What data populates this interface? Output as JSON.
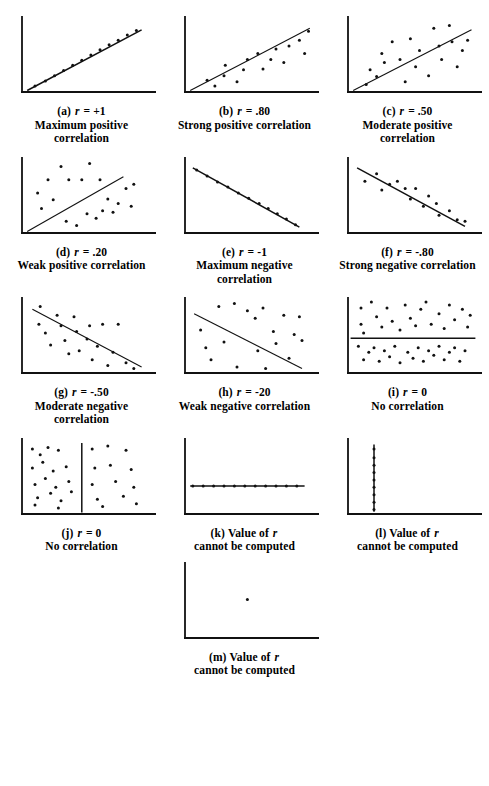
{
  "figure": {
    "ink_color": "#111111",
    "background": "#ffffff",
    "panel_count": 13
  },
  "chart_data": {
    "type": "scatter",
    "xlabel": "",
    "ylabel": "",
    "xlim": [
      0,
      100
    ],
    "ylim": [
      0,
      100
    ],
    "grid": false,
    "legend": "none",
    "panels": [
      {
        "id": "a",
        "label": "(a)",
        "r_text": "r = +1",
        "r_value": 1.0,
        "caption_line1": "Maximum positive",
        "caption_line2": "correlation",
        "has_line": true,
        "line": {
          "x1": 4,
          "y1": 2,
          "x2": 92,
          "y2": 84
        },
        "points": [
          [
            10,
            8
          ],
          [
            18,
            15
          ],
          [
            25,
            22
          ],
          [
            32,
            29
          ],
          [
            39,
            36
          ],
          [
            46,
            43
          ],
          [
            53,
            50
          ],
          [
            60,
            57
          ],
          [
            67,
            64
          ],
          [
            74,
            70
          ],
          [
            81,
            77
          ],
          [
            88,
            83
          ]
        ]
      },
      {
        "id": "b",
        "label": "(b)",
        "r_text": "r = .80",
        "r_value": 0.8,
        "caption_line1": "Strong positive correlation",
        "caption_line2": "",
        "has_line": true,
        "line": {
          "x1": 4,
          "y1": 2,
          "x2": 96,
          "y2": 86
        },
        "points": [
          [
            17,
            16
          ],
          [
            23,
            8
          ],
          [
            30,
            22
          ],
          [
            31,
            36
          ],
          [
            40,
            14
          ],
          [
            45,
            30
          ],
          [
            48,
            44
          ],
          [
            56,
            52
          ],
          [
            60,
            31
          ],
          [
            66,
            44
          ],
          [
            70,
            58
          ],
          [
            76,
            40
          ],
          [
            80,
            62
          ],
          [
            88,
            70
          ],
          [
            92,
            52
          ],
          [
            95,
            82
          ]
        ]
      },
      {
        "id": "c",
        "label": "(c)",
        "r_text": "r = .50",
        "r_value": 0.5,
        "caption_line1": "Moderate positive",
        "caption_line2": "correlation",
        "has_line": true,
        "line": {
          "x1": 4,
          "y1": 2,
          "x2": 95,
          "y2": 84
        },
        "points": [
          [
            14,
            10
          ],
          [
            17,
            30
          ],
          [
            22,
            21
          ],
          [
            26,
            52
          ],
          [
            28,
            40
          ],
          [
            34,
            68
          ],
          [
            40,
            44
          ],
          [
            44,
            14
          ],
          [
            48,
            72
          ],
          [
            52,
            34
          ],
          [
            55,
            56
          ],
          [
            62,
            22
          ],
          [
            66,
            86
          ],
          [
            70,
            62
          ],
          [
            72,
            44
          ],
          [
            78,
            90
          ],
          [
            80,
            68
          ],
          [
            84,
            34
          ],
          [
            88,
            56
          ],
          [
            92,
            70
          ]
        ]
      },
      {
        "id": "d",
        "label": "(d)",
        "r_text": "r = .20",
        "r_value": 0.2,
        "caption_line1": "Weak positive correlation",
        "caption_line2": "",
        "has_line": true,
        "line": {
          "x1": 4,
          "y1": 2,
          "x2": 78,
          "y2": 76
        },
        "points": [
          [
            12,
            54
          ],
          [
            15,
            33
          ],
          [
            20,
            72
          ],
          [
            24,
            45
          ],
          [
            30,
            90
          ],
          [
            34,
            16
          ],
          [
            36,
            72
          ],
          [
            42,
            10
          ],
          [
            46,
            72
          ],
          [
            50,
            26
          ],
          [
            52,
            94
          ],
          [
            57,
            20
          ],
          [
            60,
            72
          ],
          [
            62,
            30
          ],
          [
            66,
            46
          ],
          [
            70,
            28
          ],
          [
            74,
            40
          ],
          [
            80,
            60
          ],
          [
            84,
            36
          ],
          [
            86,
            66
          ]
        ]
      },
      {
        "id": "e",
        "label": "(e)",
        "r_text": "r = -1",
        "r_value": -1.0,
        "caption_line1": "Maximum negative",
        "caption_line2": "correlation",
        "has_line": true,
        "line": {
          "x1": 6,
          "y1": 88,
          "x2": 88,
          "y2": 8
        },
        "points": [
          [
            9,
            85
          ],
          [
            17,
            77
          ],
          [
            25,
            69
          ],
          [
            33,
            62
          ],
          [
            41,
            54
          ],
          [
            49,
            47
          ],
          [
            57,
            40
          ],
          [
            64,
            33
          ],
          [
            71,
            26
          ],
          [
            78,
            19
          ],
          [
            85,
            11
          ]
        ]
      },
      {
        "id": "f",
        "label": "(f)",
        "r_text": "r = -.80",
        "r_value": -0.8,
        "caption_line1": "Strong negative correlation",
        "caption_line2": "",
        "has_line": true,
        "line": {
          "x1": 7,
          "y1": 88,
          "x2": 90,
          "y2": 9
        },
        "points": [
          [
            13,
            70
          ],
          [
            22,
            80
          ],
          [
            26,
            58
          ],
          [
            32,
            66
          ],
          [
            38,
            70
          ],
          [
            44,
            60
          ],
          [
            48,
            46
          ],
          [
            52,
            60
          ],
          [
            58,
            36
          ],
          [
            62,
            50
          ],
          [
            68,
            40
          ],
          [
            70,
            24
          ],
          [
            78,
            30
          ],
          [
            84,
            18
          ],
          [
            90,
            16
          ]
        ]
      },
      {
        "id": "g",
        "label": "(g)",
        "r_text": "r = -.50",
        "r_value": -0.5,
        "caption_line1": "Moderate negative",
        "caption_line2": "correlation",
        "has_line": true,
        "line": {
          "x1": 8,
          "y1": 86,
          "x2": 92,
          "y2": 8
        },
        "points": [
          [
            14,
            90
          ],
          [
            13,
            66
          ],
          [
            18,
            54
          ],
          [
            22,
            38
          ],
          [
            27,
            78
          ],
          [
            30,
            64
          ],
          [
            33,
            44
          ],
          [
            36,
            26
          ],
          [
            40,
            76
          ],
          [
            42,
            56
          ],
          [
            44,
            30
          ],
          [
            50,
            46
          ],
          [
            52,
            64
          ],
          [
            54,
            18
          ],
          [
            58,
            36
          ],
          [
            62,
            66
          ],
          [
            66,
            10
          ],
          [
            70,
            28
          ],
          [
            74,
            66
          ],
          [
            80,
            14
          ],
          [
            86,
            6
          ]
        ]
      },
      {
        "id": "h",
        "label": "(h)",
        "r_text": "r = -20",
        "r_value": -0.2,
        "caption_line1": "Weak negative correlation",
        "caption_line2": "",
        "has_line": true,
        "line": {
          "x1": 7,
          "y1": 80,
          "x2": 90,
          "y2": 6
        },
        "points": [
          [
            12,
            58
          ],
          [
            16,
            34
          ],
          [
            20,
            18
          ],
          [
            26,
            90
          ],
          [
            30,
            42
          ],
          [
            38,
            94
          ],
          [
            40,
            8
          ],
          [
            48,
            84
          ],
          [
            54,
            74
          ],
          [
            56,
            30
          ],
          [
            60,
            88
          ],
          [
            62,
            6
          ],
          [
            68,
            56
          ],
          [
            70,
            40
          ],
          [
            76,
            78
          ],
          [
            80,
            20
          ],
          [
            84,
            52
          ],
          [
            88,
            76
          ],
          [
            90,
            44
          ]
        ]
      },
      {
        "id": "i",
        "label": "(i)",
        "r_text": "r = 0",
        "r_value": 0.0,
        "caption_line1": "No correlation",
        "caption_line2": "",
        "has_line": true,
        "line": {
          "x1": 2,
          "y1": 47,
          "x2": 98,
          "y2": 47
        },
        "line_style": "horizontal",
        "points": [
          [
            10,
            88
          ],
          [
            10,
            66
          ],
          [
            12,
            54
          ],
          [
            18,
            96
          ],
          [
            22,
            76
          ],
          [
            26,
            62
          ],
          [
            30,
            88
          ],
          [
            34,
            70
          ],
          [
            40,
            58
          ],
          [
            44,
            92
          ],
          [
            48,
            74
          ],
          [
            52,
            64
          ],
          [
            56,
            86
          ],
          [
            60,
            96
          ],
          [
            64,
            66
          ],
          [
            70,
            80
          ],
          [
            74,
            60
          ],
          [
            78,
            92
          ],
          [
            82,
            72
          ],
          [
            88,
            86
          ],
          [
            92,
            62
          ],
          [
            94,
            78
          ],
          [
            8,
            36
          ],
          [
            12,
            18
          ],
          [
            16,
            28
          ],
          [
            20,
            34
          ],
          [
            24,
            16
          ],
          [
            28,
            30
          ],
          [
            32,
            22
          ],
          [
            36,
            36
          ],
          [
            40,
            14
          ],
          [
            46,
            28
          ],
          [
            50,
            20
          ],
          [
            54,
            34
          ],
          [
            58,
            16
          ],
          [
            62,
            30
          ],
          [
            66,
            24
          ],
          [
            70,
            36
          ],
          [
            74,
            18
          ],
          [
            78,
            28
          ],
          [
            82,
            34
          ],
          [
            86,
            16
          ],
          [
            90,
            30
          ]
        ]
      },
      {
        "id": "j",
        "label": "(j)",
        "r_text": "r = 0",
        "r_value": 0.0,
        "caption_line1": "No correlation",
        "caption_line2": "",
        "has_line": true,
        "line": {
          "x1": 46,
          "y1": 2,
          "x2": 46,
          "y2": 96
        },
        "line_style": "vertical",
        "points": [
          [
            8,
            88
          ],
          [
            14,
            80
          ],
          [
            20,
            90
          ],
          [
            28,
            86
          ],
          [
            8,
            62
          ],
          [
            16,
            70
          ],
          [
            24,
            58
          ],
          [
            34,
            64
          ],
          [
            10,
            40
          ],
          [
            18,
            48
          ],
          [
            26,
            36
          ],
          [
            36,
            44
          ],
          [
            12,
            22
          ],
          [
            22,
            28
          ],
          [
            30,
            18
          ],
          [
            38,
            30
          ],
          [
            10,
            12
          ],
          [
            28,
            8
          ],
          [
            54,
            88
          ],
          [
            66,
            92
          ],
          [
            80,
            86
          ],
          [
            56,
            62
          ],
          [
            68,
            66
          ],
          [
            84,
            60
          ],
          [
            54,
            40
          ],
          [
            72,
            44
          ],
          [
            86,
            36
          ],
          [
            58,
            20
          ],
          [
            78,
            24
          ],
          [
            88,
            14
          ],
          [
            62,
            10
          ]
        ]
      },
      {
        "id": "k",
        "label": "(k)",
        "r_text": "Value of  r",
        "r_value": null,
        "caption_line1": "cannot be computed",
        "caption_line2": "",
        "has_line": true,
        "line": {
          "x1": 4,
          "y1": 38,
          "x2": 92,
          "y2": 38
        },
        "line_style": "horizontal",
        "points": [
          [
            6,
            38
          ],
          [
            14,
            38
          ],
          [
            22,
            38
          ],
          [
            30,
            38
          ],
          [
            38,
            38
          ],
          [
            46,
            38
          ],
          [
            54,
            38
          ],
          [
            62,
            38
          ],
          [
            70,
            38
          ],
          [
            78,
            38
          ],
          [
            86,
            38
          ]
        ]
      },
      {
        "id": "l",
        "label": "(l)",
        "r_text": "Value of  r",
        "r_value": null,
        "caption_line1": "cannot be computed",
        "caption_line2": "",
        "has_line": true,
        "line": {
          "x1": 20,
          "y1": 3,
          "x2": 20,
          "y2": 94
        },
        "line_style": "vertical",
        "points": [
          [
            20,
            6
          ],
          [
            20,
            16
          ],
          [
            20,
            26
          ],
          [
            20,
            36
          ],
          [
            20,
            46
          ],
          [
            20,
            56
          ],
          [
            20,
            66
          ],
          [
            20,
            76
          ],
          [
            20,
            88
          ]
        ]
      },
      {
        "id": "m",
        "label": "(m)",
        "r_text": "Value of  r",
        "r_value": null,
        "caption_line1": "cannot be computed",
        "caption_line2": "",
        "has_line": false,
        "line": null,
        "points": [
          [
            48,
            52
          ]
        ]
      }
    ]
  }
}
